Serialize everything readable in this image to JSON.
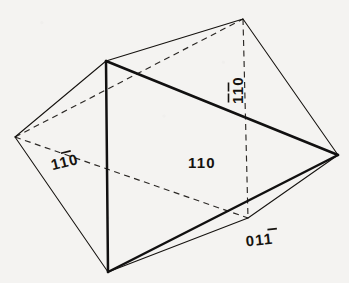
{
  "figure": {
    "kind": "crystal-form-line-drawing",
    "background_color": "#f4f3f1",
    "ink_color": "#16130f",
    "vertices": {
      "top": {
        "x": 243,
        "y": 19
      },
      "upper_left": {
        "x": 106,
        "y": 61
      },
      "left": {
        "x": 15,
        "y": 137
      },
      "right": {
        "x": 338,
        "y": 155
      },
      "bottom": {
        "x": 108,
        "y": 272
      },
      "back_lower": {
        "x": 248,
        "y": 218
      }
    },
    "labels": [
      {
        "id": "face-110",
        "text": "110",
        "overbars": [],
        "x": 202,
        "y": 168,
        "rotation": 0,
        "face": "front-right"
      },
      {
        "id": "face-1bar10",
        "text": "110",
        "overbars": [
          1
        ],
        "x": 66,
        "y": 167,
        "rotation": -14,
        "face": "front-left-hidden"
      },
      {
        "id": "face-1bar1bar0",
        "text": "110",
        "overbars": [
          0,
          1
        ],
        "x": 243,
        "y": 90,
        "rotation": -90,
        "face": "top-right-rear"
      },
      {
        "id": "face-011bar",
        "text": "011",
        "overbars": [
          2
        ],
        "x": 260,
        "y": 245,
        "rotation": -6,
        "face": "bottom-rear"
      }
    ],
    "edges": {
      "solid_thin": [
        [
          "top",
          "upper_left"
        ],
        [
          "left",
          "upper_left"
        ],
        [
          "left",
          "bottom"
        ],
        [
          "top",
          "right"
        ],
        [
          "right",
          "back_lower"
        ],
        [
          "back_lower",
          "bottom"
        ]
      ],
      "solid_bold": [
        [
          "upper_left",
          "right"
        ],
        [
          "right",
          "bottom"
        ],
        [
          "upper_left",
          "bottom"
        ]
      ],
      "hidden_dashed": [
        [
          "left",
          "top"
        ],
        [
          "left",
          "back_lower"
        ],
        [
          "top",
          "back_lower"
        ]
      ]
    }
  }
}
